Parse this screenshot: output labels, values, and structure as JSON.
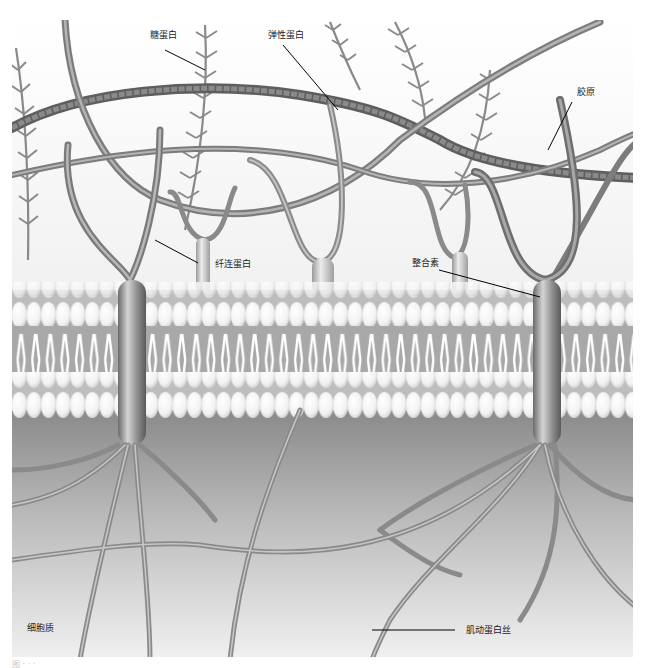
{
  "figure": {
    "labels": {
      "proteoglycan": "糖蛋白",
      "elastin": "弹性蛋白",
      "collagen": "胶原",
      "fibronectin": "纤连蛋白",
      "integrin": "整合素",
      "cytoplasm": "细胞质",
      "actin_filament": "肌动蛋白丝"
    },
    "caption": "图 · · ·",
    "colors": {
      "background": "#ffffff",
      "ecm_space": "#f4f4f4",
      "membrane_head": "#f2f2f2",
      "membrane_tail": "#9a9a9a",
      "cytoplasm_top": "#8d8d8d",
      "cytoplasm_bottom": "#efefef",
      "fiber": "#8a8a8a",
      "collagen": "#6b6b6b",
      "integrin": "#7a7a7a",
      "leader_line": "#000000"
    }
  }
}
